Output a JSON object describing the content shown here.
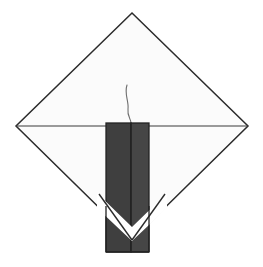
{
  "figure": {
    "type": "line-drawing",
    "canvas": {
      "width": 263,
      "height": 267,
      "background": "#ffffff"
    },
    "colors": {
      "background": "#ffffff",
      "napkin_fill": "#fbfbfb",
      "napkin_stroke": "#2b2b2b",
      "candle_left_fill": "#3f3f3f",
      "candle_right_fill": "#464646",
      "candle_stroke": "#232323",
      "wick_stroke": "#6e6e6e",
      "fold_line_stroke": "#3a3a3a"
    },
    "shapes": {
      "napkin_diamond": {
        "label": "diamond-napkin",
        "points": "132,13 248,126 132,240 16,126",
        "fill": "#fbfbfb",
        "stroke": "#2b2b2b",
        "stroke_width": 1.5
      },
      "fold_line_horizontal": {
        "label": "horizontal-fold-line",
        "x1": 16,
        "y1": 126,
        "x2": 248,
        "y2": 126,
        "stroke": "#3a3a3a",
        "stroke_width": 1.2
      },
      "candle_left_block": {
        "label": "candle-left-face",
        "x": 106,
        "y": 123,
        "width": 25,
        "height": 129,
        "fill": "#3f3f3f",
        "stroke": "#232323",
        "stroke_width": 1.3
      },
      "candle_right_block": {
        "label": "candle-right-face",
        "x": 131,
        "y": 123,
        "width": 18,
        "height": 129,
        "fill": "#464646",
        "stroke": "#232323",
        "stroke_width": 1.3
      },
      "candle_center_seam": {
        "label": "candle-vertical-seam",
        "x1": 131,
        "y1": 123,
        "x2": 131,
        "y2": 252,
        "stroke": "#232323",
        "stroke_width": 1.1
      },
      "napkin_v_notch": {
        "label": "napkin-lower-point-overlay",
        "points": "99,210 132,240 165,210 165,196 132,226 99,196",
        "fill": "#ffffff"
      },
      "napkin_v_edge_left": {
        "label": "napkin-lower-left-edge",
        "x1": 99,
        "y1": 196,
        "x2": 132,
        "y2": 240,
        "stroke": "#2b2b2b",
        "stroke_width": 1.4
      },
      "napkin_v_edge_right": {
        "label": "napkin-lower-right-edge",
        "x1": 132,
        "y1": 240,
        "x2": 165,
        "y2": 196,
        "stroke": "#2b2b2b",
        "stroke_width": 1.4
      },
      "candle_wick": {
        "label": "candle-wick",
        "path": "M127,85 C124,94 129,101 128,109 C127,116 131,119 131,123",
        "stroke": "#6e6e6e",
        "stroke_width": 1.1
      }
    },
    "annotations": {
      "caption": "",
      "labels": []
    }
  }
}
